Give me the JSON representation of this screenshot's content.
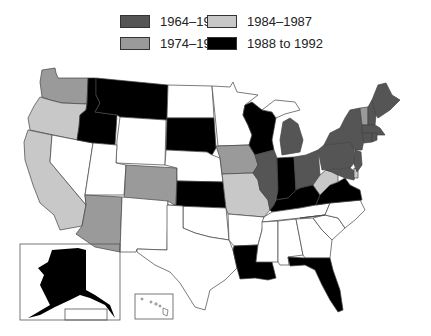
{
  "legend": {
    "items": [
      {
        "label": "1964–1974",
        "color": "#555555"
      },
      {
        "label": "1984–1987",
        "color": "#c8c8c8"
      },
      {
        "label": "1974–1984",
        "color": "#9a9a9a"
      },
      {
        "label": "1988 to 1992",
        "color": "#000000"
      }
    ]
  },
  "map": {
    "title": "United States map shaded by period",
    "categories": {
      "1964–1974": [
        "MI",
        "OH",
        "PA",
        "NY",
        "ME",
        "NH",
        "MA",
        "CT",
        "RI",
        "NJ",
        "MD",
        "IL"
      ],
      "1974–1984": [
        "WA",
        "CO",
        "AZ",
        "IA",
        "VT"
      ],
      "1984–1987": [
        "OR",
        "CA",
        "MO",
        "WV",
        "DE"
      ],
      "1988 to 1992": [
        "ID",
        "MT",
        "SD",
        "KS",
        "WI",
        "IN",
        "KY",
        "VA",
        "LA",
        "FL",
        "AK"
      ]
    },
    "insets": [
      "Alaska",
      "Hawaii"
    ]
  }
}
